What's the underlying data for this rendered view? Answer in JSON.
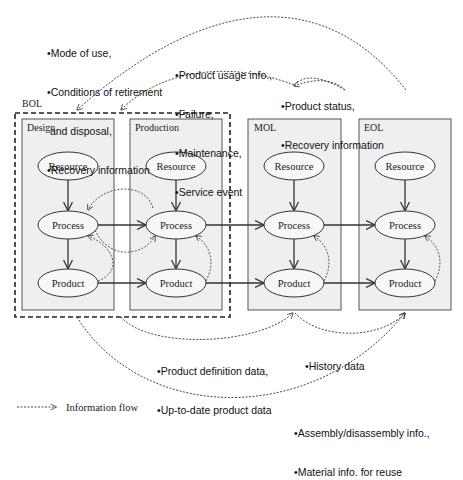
{
  "diagram": {
    "group_label": "BOL",
    "phases": [
      {
        "id": "design",
        "label": "Design"
      },
      {
        "id": "production",
        "label": "Production"
      },
      {
        "id": "mol",
        "label": "MOL"
      },
      {
        "id": "eol",
        "label": "EOL"
      }
    ],
    "nodes": {
      "resource": "Resource",
      "process": "Process",
      "product": "Product"
    },
    "notes": {
      "top_left": [
        "•Mode of use,",
        "•Conditions of retirement",
        " and disposal,",
        "•Recovery information"
      ],
      "top_middle": [
        "•Product usage info.,",
        "•Failure,",
        "•Maintenance,",
        "•Service event"
      ],
      "top_right": [
        "•Product status,",
        "•Recovery information"
      ],
      "bottom_middle": [
        "•Product definition data,",
        "•Up-to-date product data"
      ],
      "bottom_right_upper": [
        "•History data"
      ],
      "bottom_right_lower": [
        "•Assembly/disassembly info.,",
        "•Material info. for reuse"
      ]
    },
    "legend": {
      "label": "Information flow"
    },
    "colors": {
      "box_fill": "#efefef",
      "box_stroke": "#555555",
      "ellipse_fill": "#f7f7f7",
      "arrow": "#333333",
      "dashed": "#222222"
    }
  }
}
